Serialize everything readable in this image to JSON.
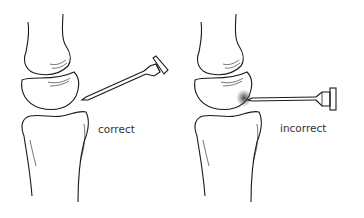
{
  "figure": {
    "panels": [
      {
        "id": "correct",
        "label": "correct",
        "needle_direction": "angled-upward-right"
      },
      {
        "id": "incorrect",
        "label": "incorrect",
        "needle_direction": "horizontal-right"
      }
    ],
    "colors": {
      "line": "#1a1a1a",
      "background": "#ffffff",
      "text": "#333333",
      "shadow": "#222222"
    }
  }
}
